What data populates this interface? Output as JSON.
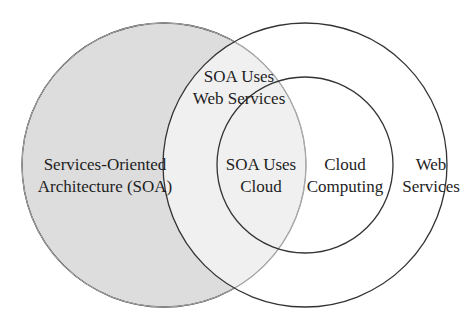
{
  "diagram": {
    "type": "venn",
    "colors": {
      "soa_fill": "#dddddd",
      "background": "#ffffff",
      "stroke": "#333333",
      "soa_inner_edge": "#a9a9a9",
      "text": "#1e1e1e"
    },
    "sets": [
      {
        "id": "soa",
        "lines": [
          "Services-Oriented",
          "Architecture (SOA)"
        ]
      },
      {
        "id": "web-services",
        "lines": [
          "Web",
          "Services"
        ]
      },
      {
        "id": "cloud-computing",
        "lines": [
          "Cloud",
          "Computing"
        ]
      }
    ],
    "intersections": [
      {
        "id": "soa-web",
        "lines": [
          "SOA Uses",
          "Web Services"
        ]
      },
      {
        "id": "soa-cloud",
        "lines": [
          "SOA Uses",
          "Cloud"
        ]
      }
    ]
  }
}
